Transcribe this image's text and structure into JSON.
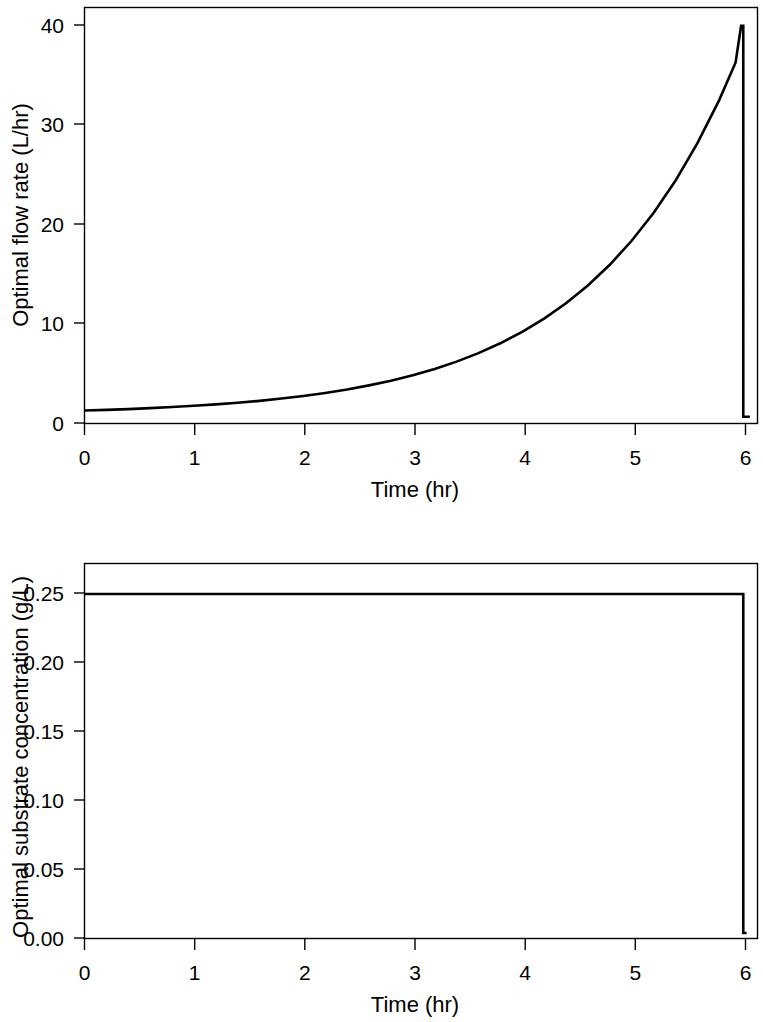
{
  "figure": {
    "background_color": "#ffffff",
    "line_color": "#000000"
  },
  "chart_data": [
    {
      "type": "line",
      "id": "optimal-flow-rate",
      "title": "",
      "xlabel": "Time (hr)",
      "ylabel": "Optimal flow rate (L/hr)",
      "xlim": [
        0,
        6.15
      ],
      "ylim": [
        -0.9,
        42.4
      ],
      "xticks": [
        0,
        1,
        2,
        3,
        4,
        5,
        6
      ],
      "xticklabels": [
        "0",
        "1",
        "2",
        "3",
        "4",
        "5",
        "6"
      ],
      "yticks": [
        0,
        10,
        20,
        30,
        40
      ],
      "yticklabels": [
        "0",
        "10",
        "20",
        "30",
        "40"
      ],
      "grid": false,
      "legend": "none",
      "frame": "box",
      "series": [
        {
          "name": "Optimal flow rate",
          "x": [
            0.0,
            0.2,
            0.4,
            0.6,
            0.8,
            1.0,
            1.2,
            1.4,
            1.6,
            1.8,
            2.0,
            2.2,
            2.4,
            2.6,
            2.8,
            3.0,
            3.2,
            3.4,
            3.6,
            3.8,
            4.0,
            4.2,
            4.4,
            4.6,
            4.8,
            5.0,
            5.2,
            5.4,
            5.6,
            5.8,
            5.95,
            6.0,
            6.02,
            6.02,
            6.08
          ],
          "y": [
            0.45,
            0.52,
            0.6,
            0.7,
            0.81,
            0.94,
            1.09,
            1.26,
            1.46,
            1.7,
            1.97,
            2.28,
            2.64,
            3.07,
            3.55,
            4.12,
            4.78,
            5.54,
            6.42,
            7.45,
            8.64,
            10.02,
            11.62,
            13.47,
            15.62,
            18.12,
            21.01,
            24.36,
            28.25,
            32.76,
            36.68,
            40.5,
            40.5,
            -0.2,
            -0.2
          ],
          "annotation": "exponential rise from ~0.45 L/hr at t=0 to peak ~40.5 L/hr at t=6, then abrupt drop to ~0"
        }
      ]
    },
    {
      "type": "line",
      "id": "optimal-substrate-concentration",
      "title": "",
      "xlabel": "Time (hr)",
      "ylabel": "Optimal substrate concentration (g/L)",
      "xlim": [
        0,
        6.15
      ],
      "ylim": [
        -0.004,
        0.2665
      ],
      "xticks": [
        0,
        1,
        2,
        3,
        4,
        5,
        6
      ],
      "xticklabels": [
        "0",
        "1",
        "2",
        "3",
        "4",
        "5",
        "6"
      ],
      "yticks": [
        0.0,
        0.05,
        0.1,
        0.15,
        0.2,
        0.25
      ],
      "yticklabels": [
        "0.00",
        "0.05",
        "0.10",
        "0.15",
        "0.20",
        "0.25"
      ],
      "grid": false,
      "legend": "none",
      "frame": "box",
      "series": [
        {
          "name": "Optimal substrate concentration",
          "x": [
            0.0,
            1.0,
            2.0,
            3.0,
            4.0,
            5.0,
            5.8,
            6.02,
            6.02,
            6.05
          ],
          "y": [
            0.2445,
            0.2445,
            0.2445,
            0.2445,
            0.2445,
            0.2445,
            0.2445,
            0.2445,
            0.0,
            0.0
          ],
          "annotation": "held constant at ~0.245 g/L through t=6, then sharp drop to 0"
        }
      ]
    }
  ]
}
